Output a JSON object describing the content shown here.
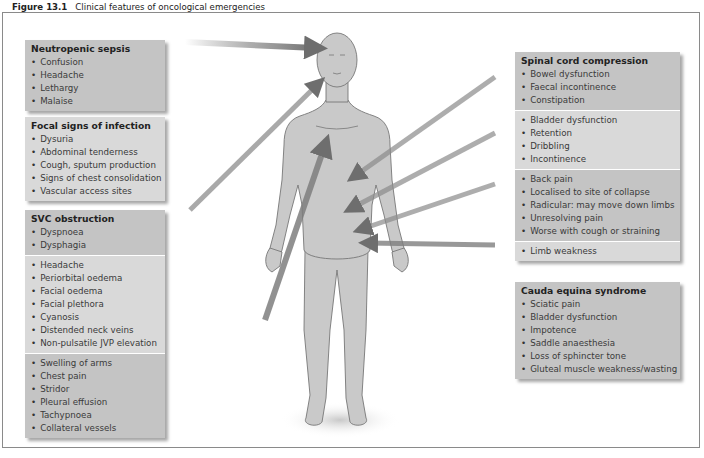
{
  "figure": {
    "number": "Figure 13.1",
    "title": "Clinical features of oncological emergencies"
  },
  "colors": {
    "box_dark": "#c4c4c4",
    "box_light": "#d9d9d9",
    "arrow": "#7a7a7a",
    "body_fill": "#c9c9c9",
    "body_outline": "#777777"
  },
  "boxes": {
    "neutropenic_sepsis": {
      "title": "Neutropenic sepsis",
      "items": [
        "Confusion",
        "Headache",
        "Lethargy",
        "Malaise"
      ]
    },
    "focal_signs": {
      "title": "Focal signs of infection",
      "items": [
        "Dysuria",
        "Abdominal tenderness",
        "Cough, sputum production",
        "Signs of chest consolidation",
        "Vascular access sites"
      ]
    },
    "svc_obstruction": {
      "title": "SVC obstruction",
      "sections": [
        [
          "Dyspnoea",
          "Dysphagia"
        ],
        [
          "Headache",
          "Periorbital oedema",
          "Facial oedema",
          "Facial plethora",
          "Cyanosis",
          "Distended neck veins",
          "Non-pulsatile JVP elevation"
        ],
        [
          "Swelling of arms",
          "Chest pain",
          "Stridor",
          "Pleural effusion",
          "Tachypnoea",
          "Collateral vessels"
        ]
      ]
    },
    "spinal_cord": {
      "title": "Spinal cord compression",
      "sections": [
        [
          "Bowel dysfunction",
          "Faecal incontinence",
          "Constipation"
        ],
        [
          "Bladder dysfunction",
          "Retention",
          "Dribbling",
          "Incontinence"
        ],
        [
          "Back pain",
          "Localised to site of collapse",
          "Radicular: may move down limbs",
          "Unresolving pain",
          "Worse with cough or straining"
        ],
        [
          "Limb weakness"
        ]
      ]
    },
    "cauda_equina": {
      "title": "Cauda equina syndrome",
      "items": [
        "Sciatic pain",
        "Bladder dysfunction",
        "Impotence",
        "Saddle anaesthesia",
        "Loss of sphincter tone",
        "Gluteal muscle weakness/wasting"
      ]
    }
  }
}
